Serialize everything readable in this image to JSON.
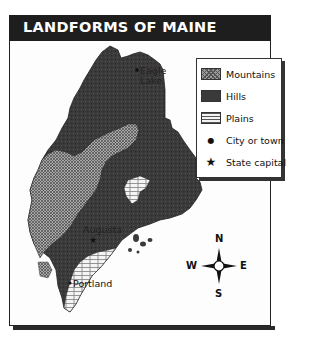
{
  "title": "LANDFORMS OF MAINE",
  "legend": {
    "items": [
      {
        "key": "mountains",
        "label": "Mountains",
        "symbol": "crosshatch-swatch"
      },
      {
        "key": "hills",
        "label": "Hills",
        "symbol": "dark-swatch"
      },
      {
        "key": "plains",
        "label": "Plains",
        "symbol": "brick-swatch"
      },
      {
        "key": "city",
        "label": "City or town",
        "symbol": "dot-icon",
        "glyph": "●"
      },
      {
        "key": "capital",
        "label": "State capital",
        "symbol": "star-icon",
        "glyph": "★"
      }
    ]
  },
  "places": [
    {
      "name": "Eagle Lake",
      "line1": "Eagle",
      "line2": "Lake",
      "type": "city"
    },
    {
      "name": "Augusta",
      "type": "capital"
    },
    {
      "name": "Portland",
      "type": "city"
    }
  ],
  "compass": {
    "north": "N",
    "south": "S",
    "east": "E",
    "west": "W"
  },
  "colors": {
    "title_bar": "#1e1e1e",
    "hills": "#3a3a3a",
    "mountains": "#9a9a9a",
    "plains": "#f2f2f2"
  }
}
